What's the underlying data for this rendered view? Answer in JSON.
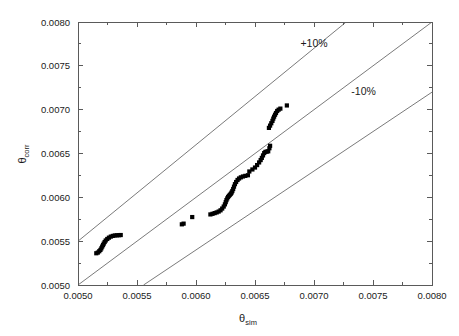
{
  "chart_data": {
    "type": "scatter",
    "title": "",
    "subtitle": "",
    "xlabel": "θ",
    "xlabel_sub": "sim",
    "ylabel": "θ",
    "ylabel_sub": "corr",
    "xlim": [
      0.005,
      0.008
    ],
    "ylim": [
      0.005,
      0.008
    ],
    "grid": false,
    "legend_position": "none",
    "xticks": [
      "0.0050",
      "0.0055",
      "0.0060",
      "0.0065",
      "0.0070",
      "0.0075",
      "0.0080"
    ],
    "xtick_values": [
      0.005,
      0.0055,
      0.006,
      0.0065,
      0.007,
      0.0075,
      0.008
    ],
    "yticks": [
      "0.0050",
      "0.0055",
      "0.0060",
      "0.0065",
      "0.0070",
      "0.0075",
      "0.0080"
    ],
    "ytick_values": [
      0.005,
      0.0055,
      0.006,
      0.0065,
      0.007,
      0.0075,
      0.008
    ],
    "minor_ticks_per_interval": 1,
    "marker": "filled-square",
    "marker_size_px": 4.2,
    "marker_color": "#000000",
    "annotations": [
      {
        "name": "plus-ten-percent",
        "text": "+10%",
        "x": 0.007,
        "y": 0.00772
      },
      {
        "name": "minus-ten-percent",
        "text": "-10%",
        "x": 0.00742,
        "y": 0.00717
      }
    ],
    "reference_lines": [
      {
        "name": "parity-line",
        "label": "y = x",
        "slope": 1.0,
        "intercept": 0.0
      },
      {
        "name": "plus-10-percent-line",
        "label": "+10%",
        "slope": 1.1,
        "intercept": 0.0
      },
      {
        "name": "minus-10-percent-line",
        "label": "-10%",
        "slope": 0.9,
        "intercept": 0.0
      }
    ],
    "series": [
      {
        "name": "theta data",
        "points": [
          [
            0.005155,
            0.005362
          ],
          [
            0.005168,
            0.00537
          ],
          [
            0.00518,
            0.005385
          ],
          [
            0.00519,
            0.0054
          ],
          [
            0.005198,
            0.005418
          ],
          [
            0.005205,
            0.005438
          ],
          [
            0.005212,
            0.005455
          ],
          [
            0.005218,
            0.005472
          ],
          [
            0.005226,
            0.00549
          ],
          [
            0.005235,
            0.005508
          ],
          [
            0.005248,
            0.005525
          ],
          [
            0.005262,
            0.00554
          ],
          [
            0.005278,
            0.005552
          ],
          [
            0.005295,
            0.00556
          ],
          [
            0.005312,
            0.005565
          ],
          [
            0.00533,
            0.005567
          ],
          [
            0.005348,
            0.005568
          ],
          [
            0.005362,
            0.00557
          ],
          [
            0.00588,
            0.005692
          ],
          [
            0.005895,
            0.0057
          ],
          [
            0.005968,
            0.005775
          ],
          [
            0.006122,
            0.005805
          ],
          [
            0.00614,
            0.005812
          ],
          [
            0.006158,
            0.00582
          ],
          [
            0.006175,
            0.005828
          ],
          [
            0.006192,
            0.005838
          ],
          [
            0.006208,
            0.005852
          ],
          [
            0.006222,
            0.005872
          ],
          [
            0.006235,
            0.005895
          ],
          [
            0.006245,
            0.00592
          ],
          [
            0.006252,
            0.005945
          ],
          [
            0.006258,
            0.005968
          ],
          [
            0.006265,
            0.005988
          ],
          [
            0.006272,
            0.006005
          ],
          [
            0.00628,
            0.006018
          ],
          [
            0.006288,
            0.00603
          ],
          [
            0.006296,
            0.006042
          ],
          [
            0.006302,
            0.006055
          ],
          [
            0.006308,
            0.006072
          ],
          [
            0.006315,
            0.006095
          ],
          [
            0.006322,
            0.006122
          ],
          [
            0.00633,
            0.00615
          ],
          [
            0.00634,
            0.006175
          ],
          [
            0.006352,
            0.006198
          ],
          [
            0.006365,
            0.006215
          ],
          [
            0.00638,
            0.006228
          ],
          [
            0.006398,
            0.006238
          ],
          [
            0.006418,
            0.006245
          ],
          [
            0.00644,
            0.006252
          ],
          [
            0.006452,
            0.006295
          ],
          [
            0.006478,
            0.006318
          ],
          [
            0.0065,
            0.00634
          ],
          [
            0.006518,
            0.006368
          ],
          [
            0.006535,
            0.006398
          ],
          [
            0.006548,
            0.006425
          ],
          [
            0.006558,
            0.00645
          ],
          [
            0.006568,
            0.006478
          ],
          [
            0.006578,
            0.006505
          ],
          [
            0.006588,
            0.006518
          ],
          [
            0.0066,
            0.006522
          ],
          [
            0.006612,
            0.006525
          ],
          [
            0.006622,
            0.00656
          ],
          [
            0.006628,
            0.006588
          ],
          [
            0.006618,
            0.006792
          ],
          [
            0.006628,
            0.006818
          ],
          [
            0.006638,
            0.006845
          ],
          [
            0.006648,
            0.006872
          ],
          [
            0.006655,
            0.006898
          ],
          [
            0.006662,
            0.00692
          ],
          [
            0.00667,
            0.006942
          ],
          [
            0.006678,
            0.006962
          ],
          [
            0.006688,
            0.006985
          ],
          [
            0.0067,
            0.007
          ],
          [
            0.006715,
            0.007012
          ],
          [
            0.00677,
            0.007048
          ]
        ]
      }
    ]
  },
  "axes": {
    "x_axis_name": "x-axis",
    "y_axis_name": "y-axis"
  }
}
